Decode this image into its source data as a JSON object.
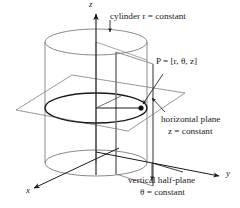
{
  "figure": {
    "title_caption": "",
    "type": "cylindrical-coordinates-diagram",
    "axes": {
      "z": "z",
      "x": "x",
      "y": "y"
    },
    "labels": {
      "cylinder": "cylinder r = constant",
      "point": "P = [r, θ, z]",
      "horizontal_plane_line1": "horizontal plane",
      "horizontal_plane_line2": "z = constant",
      "vertical_plane_line1": "vertical half-plane",
      "vertical_plane_line2": "θ = constant"
    },
    "colors": {
      "surface_line": "#7d7d7d",
      "emphasis_line": "#1a1a1a",
      "background": "#ffffff",
      "text": "#1a1a1a"
    },
    "geometry": {
      "cylinder_center_x": 96,
      "cylinder_radius_x": 51,
      "ellipse_radius_y": 13,
      "top_ellipse_y": 42,
      "mid_ellipse_y": 108,
      "bottom_ellipse_y": 163,
      "point_P": [
        141,
        108
      ]
    }
  }
}
